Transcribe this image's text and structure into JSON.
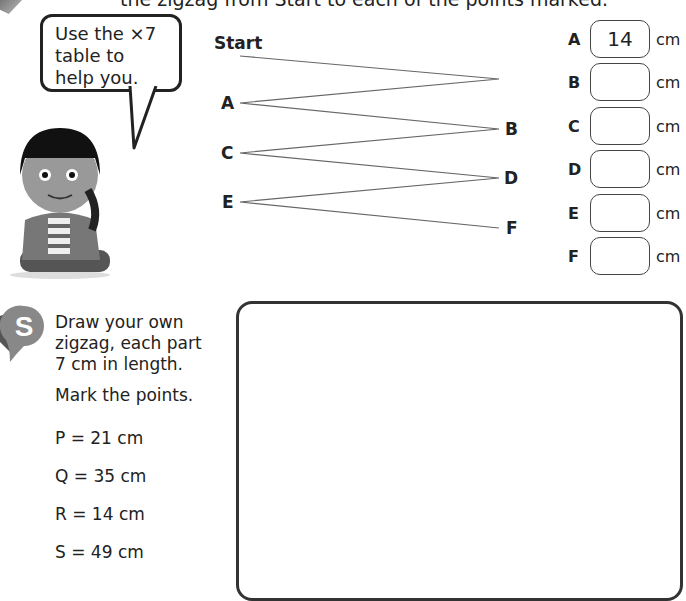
{
  "instruction_partial": "the zigzag from Start to each of the points marked.",
  "speech_bubble": {
    "lines": [
      "Use the ×7",
      "table to",
      "help you."
    ]
  },
  "zigzag": {
    "start_label": "Start",
    "points_left": [
      "A",
      "C",
      "E"
    ],
    "points_right": [
      "B",
      "D",
      "F"
    ]
  },
  "answers": [
    {
      "letter": "A",
      "value": "14",
      "unit": "cm"
    },
    {
      "letter": "B",
      "value": "",
      "unit": "cm"
    },
    {
      "letter": "C",
      "value": "",
      "unit": "cm"
    },
    {
      "letter": "D",
      "value": "",
      "unit": "cm"
    },
    {
      "letter": "E",
      "value": "",
      "unit": "cm"
    },
    {
      "letter": "F",
      "value": "",
      "unit": "cm"
    }
  ],
  "section_badge": "S",
  "task": {
    "line1": "Draw your own",
    "line2": "zigzag, each part",
    "line3": "7 cm in length.",
    "line4": "Mark the points."
  },
  "points": [
    {
      "text": "P = 21 cm"
    },
    {
      "text": "Q = 35 cm"
    },
    {
      "text": "R = 14 cm"
    },
    {
      "text": "S = 49 cm"
    }
  ]
}
